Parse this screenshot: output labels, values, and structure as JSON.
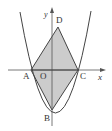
{
  "diagram": {
    "type": "geometry-graph",
    "axes": {
      "x_label": "x",
      "y_label": "y",
      "origin_label": "O"
    },
    "points": [
      {
        "name": "A",
        "label": "A"
      },
      {
        "name": "B",
        "label": "B"
      },
      {
        "name": "C",
        "label": "C"
      },
      {
        "name": "D",
        "label": "D"
      }
    ],
    "colors": {
      "stroke": "#444444",
      "fill": "#cccccc",
      "background": "#ffffff"
    }
  }
}
